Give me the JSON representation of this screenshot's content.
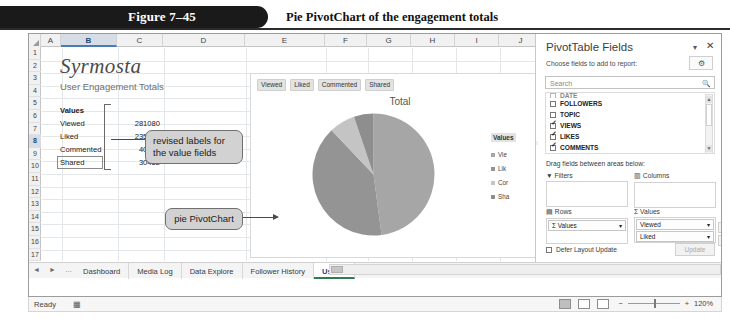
{
  "figure": {
    "number": "Figure 7–45",
    "title": "Pie PivotChart of the engagement totals"
  },
  "worksheet": {
    "columns": [
      "A",
      "B",
      "C",
      "D",
      "E",
      "F",
      "G",
      "H",
      "I",
      "J",
      "K"
    ],
    "selected_column": "B",
    "rows": [
      "1",
      "2",
      "3",
      "4",
      "5",
      "6",
      "7",
      "8",
      "9",
      "10",
      "11",
      "12",
      "13",
      "14",
      "15",
      "16",
      "17"
    ],
    "selected_row": "8",
    "company_title": "Syrmosta",
    "subtitle": "User Engagement Totals",
    "values_header": "Values",
    "data_rows": [
      {
        "label": "Viewed",
        "value": "281080"
      },
      {
        "label": "Liked",
        "value": "235129"
      },
      {
        "label": "Commented",
        "value": "40476"
      },
      {
        "label": "Shared",
        "value": "30452"
      }
    ],
    "active_cell_label": "Shared"
  },
  "callouts": [
    {
      "text": "revised labels for\nthe value fields"
    },
    {
      "text": "pie PivotChart"
    }
  ],
  "chart": {
    "title": "Total",
    "filter_buttons": [
      "Viewed",
      "Liked",
      "Commented",
      "Shared"
    ],
    "legend_title": "Values",
    "legend_items": [
      "Vie",
      "Lik",
      "Cor",
      "Sha"
    ]
  },
  "chart_data": {
    "type": "pie",
    "title": "Total",
    "categories": [
      "Viewed",
      "Liked",
      "Commented",
      "Shared"
    ],
    "values": [
      281080,
      235129,
      40476,
      30452
    ],
    "colors": [
      "#a6a6a6",
      "#949494",
      "#c4c4c4",
      "#8e8e8e"
    ],
    "legend": "right",
    "legend_title": "Values"
  },
  "tabs": {
    "nav": [
      "◄",
      "►",
      "…"
    ],
    "items": [
      {
        "label": "Dashboard",
        "active": false
      },
      {
        "label": "Media Log",
        "active": false
      },
      {
        "label": "Data Explore",
        "active": false
      },
      {
        "label": "Follower History",
        "active": false
      },
      {
        "label": "Use …",
        "active": true
      }
    ],
    "add_label": "⊕"
  },
  "status": {
    "ready": "Ready",
    "record_icon": "▦",
    "zoom": "120%"
  },
  "pane": {
    "title": "PivotTable Fields",
    "dropdown_icon": "▾",
    "close_icon": "✕",
    "subtitle": "Choose fields to add to report:",
    "gear_icon": "⚙",
    "gear_caret": "▾",
    "search_placeholder": "Search",
    "search_icon": "🔍",
    "fields": [
      {
        "label": "DATE",
        "checked": false,
        "clipped": true
      },
      {
        "label": "FOLLOWERS",
        "checked": false
      },
      {
        "label": "TOPIC",
        "checked": false
      },
      {
        "label": "VIEWS",
        "checked": true
      },
      {
        "label": "LIKES",
        "checked": true
      },
      {
        "label": "COMMENTS",
        "checked": true
      },
      {
        "label": "SHARES",
        "checked": true
      }
    ],
    "drag_label": "Drag fields between areas below:",
    "areas": {
      "filters": {
        "title": "Filters",
        "icon": "▼",
        "items": []
      },
      "columns": {
        "title": "Columns",
        "icon": "▥",
        "items": []
      },
      "rows": {
        "title": "Rows",
        "icon": "▤",
        "items": [
          "Σ Values"
        ]
      },
      "values": {
        "title": "Values",
        "icon": "Σ",
        "items": [
          "Viewed",
          "Liked"
        ]
      }
    },
    "defer_label": "Defer Layout Update",
    "update_label": "Update"
  }
}
